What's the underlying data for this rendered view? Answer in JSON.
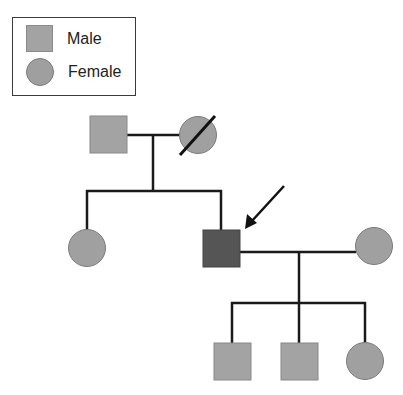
{
  "legend": {
    "items": [
      {
        "symbol": "square",
        "label": "Male"
      },
      {
        "symbol": "circle",
        "label": "Female"
      }
    ]
  },
  "colors": {
    "unaffected_fill": "#a3a3a3",
    "affected_fill": "#555555",
    "line": "#1a1a1a",
    "outline": "#7a7a7a"
  },
  "pedigree": {
    "generations": [
      {
        "level": "I",
        "members": [
          {
            "id": "I-1",
            "sex": "male",
            "status": "unaffected",
            "deceased": false
          },
          {
            "id": "I-2",
            "sex": "female",
            "status": "unaffected",
            "deceased": true
          }
        ]
      },
      {
        "level": "II",
        "members": [
          {
            "id": "II-1",
            "sex": "female",
            "status": "unaffected",
            "deceased": false
          },
          {
            "id": "II-2",
            "sex": "male",
            "status": "affected",
            "proband": true,
            "deceased": false
          },
          {
            "id": "II-3",
            "sex": "female",
            "status": "unaffected",
            "spouse_of": "II-2",
            "deceased": false
          }
        ]
      },
      {
        "level": "III",
        "members": [
          {
            "id": "III-1",
            "sex": "male",
            "status": "unaffected",
            "deceased": false
          },
          {
            "id": "III-2",
            "sex": "male",
            "status": "unaffected",
            "deceased": false
          },
          {
            "id": "III-3",
            "sex": "female",
            "status": "unaffected",
            "deceased": false
          }
        ]
      }
    ],
    "proband_marker": "arrow"
  }
}
